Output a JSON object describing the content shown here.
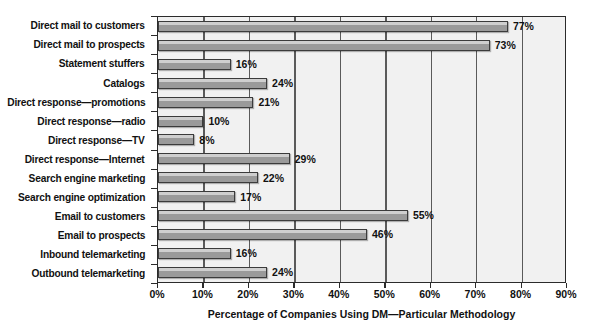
{
  "chart_data": {
    "type": "bar",
    "orientation": "horizontal",
    "title": "",
    "xlabel": "Percentage of Companies Using DM—Particular Methodology",
    "ylabel": "",
    "xlim": [
      0,
      90
    ],
    "xtick_step": 10,
    "xticks": [
      "0%",
      "10%",
      "20%",
      "30%",
      "40%",
      "50%",
      "60%",
      "70%",
      "80%",
      "90%"
    ],
    "xtick_values": [
      0,
      10,
      20,
      30,
      40,
      50,
      60,
      70,
      80,
      90
    ],
    "grid": "vertical",
    "legend": "none",
    "categories": [
      "Direct mail to customers",
      "Direct mail to prospects",
      "Statement stuffers",
      "Catalogs",
      "Direct response—promotions",
      "Direct response—radio",
      "Direct response—TV",
      "Direct response—Internet",
      "Search engine marketing",
      "Search engine optimization",
      "Email to customers",
      "Email to prospects",
      "Inbound telemarketing",
      "Outbound telemarketing"
    ],
    "values": [
      77,
      73,
      16,
      24,
      21,
      10,
      8,
      29,
      22,
      17,
      55,
      46,
      16,
      24
    ],
    "value_labels": [
      "77%",
      "73%",
      "16%",
      "24%",
      "21%",
      "10%",
      "8%",
      "29%",
      "22%",
      "17%",
      "55%",
      "46%",
      "16%",
      "24%"
    ],
    "colors": {
      "bar_fill": "#9a9a9a",
      "bar_highlight": "#cfcfcf",
      "bar_outline": "#3b3b3b",
      "plot_background": "#f1f1f1",
      "gridline": "#5a5a5a",
      "axis": "#2b2b2b",
      "text": "#111111",
      "page_background": "#ffffff"
    }
  }
}
